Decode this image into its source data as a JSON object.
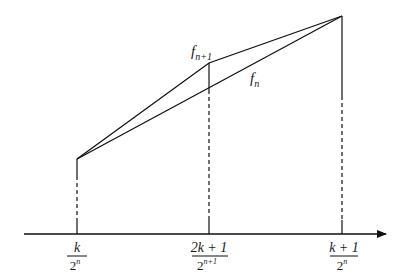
{
  "diagram": {
    "type": "piecewise-linear-function-comparison",
    "curves": [
      {
        "name": "f_{n+1}",
        "label_base": "f",
        "label_sub": "n+1",
        "points": [
          [
            77,
            159
          ],
          [
            209,
            63
          ],
          [
            342,
            16
          ]
        ]
      },
      {
        "name": "f_n",
        "label_base": "f",
        "label_sub": "n",
        "points": [
          [
            77,
            159
          ],
          [
            342,
            16
          ]
        ]
      }
    ],
    "axis": {
      "ticks": [
        {
          "numerator": "k",
          "denominator_base": "2",
          "denominator_exp": "n"
        },
        {
          "numerator": "2k + 1",
          "denominator_base": "2",
          "denominator_exp": "n+1"
        },
        {
          "numerator": "k + 1",
          "denominator_base": "2",
          "denominator_exp": "n"
        }
      ]
    }
  }
}
